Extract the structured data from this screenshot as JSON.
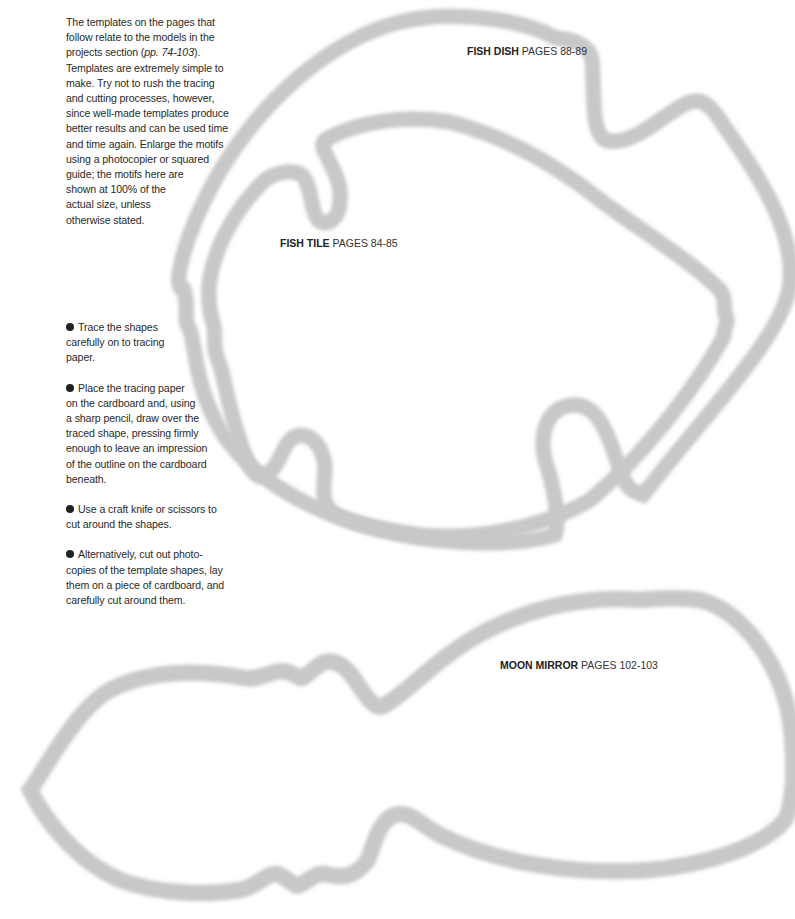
{
  "intro": {
    "text_before": "The templates on the pages that follow relate to the models in the projects section (",
    "reference": "pp. 74-103",
    "text_after": "). Templates are extremely simple to make. Try not to rush the tracing and cutting processes, however, since well-made templates produce better results and can be used time and time again. Enlarge the motifs using a photocopier or squared guide; the motifs here are shown at 100% of the actual size, unless otherwise stated.",
    "lines": [
      "The templates on the pages that",
      "follow relate to the models in the",
      "projects section (",
      "Templates are extremely simple to",
      "make. Try not to rush the tracing",
      "and cutting processes, however,",
      "since well-made templates produce",
      "better results and can be used time",
      "and time again. Enlarge the motifs",
      "using a photocopier or squared",
      "guide; the motifs here are",
      "shown at 100% of the",
      "actual size, unless",
      "otherwise stated."
    ],
    "line3_ref": "pp. 74-103",
    "line3_end": ")."
  },
  "steps": [
    {
      "bullet": "bullet-icon",
      "lines": [
        "Trace the shapes",
        "carefully on to tracing",
        "paper."
      ]
    },
    {
      "bullet": "bullet-icon",
      "lines": [
        "Place the tracing paper",
        "on the cardboard and, using",
        "a sharp pencil, draw over the",
        "traced shape, pressing firmly",
        "enough to leave an impression",
        "of the outline on the cardboard",
        "beneath."
      ]
    },
    {
      "bullet": "bullet-icon",
      "lines": [
        "Use a craft knife or scissors to",
        "cut around the shapes."
      ]
    },
    {
      "bullet": "bullet-icon",
      "lines": [
        "Alternatively, cut out photo-",
        "copies of the template shapes, lay",
        "them on a piece of cardboard, and",
        "carefully cut around them."
      ]
    }
  ],
  "templates": [
    {
      "name": "FISH DISH",
      "pages": "PAGES 88-89"
    },
    {
      "name": "FISH TILE",
      "pages": "PAGES 84-85"
    },
    {
      "name": "MOON MIRROR",
      "pages": "PAGES 102-103"
    }
  ],
  "colors": {
    "outline": "#111111",
    "shadow": "#c8c8c8",
    "text": "#2a2a2a",
    "background": "#ffffff"
  }
}
